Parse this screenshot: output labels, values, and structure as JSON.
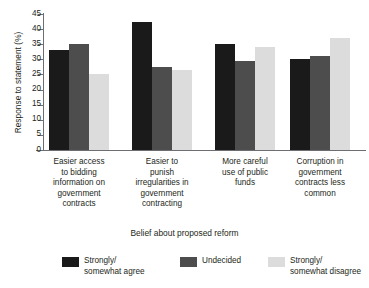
{
  "chart_data": {
    "type": "bar",
    "title": "",
    "xlabel": "Belief about proposed reform",
    "ylabel": "Response to statement (%)",
    "ylim": [
      0,
      45
    ],
    "yticks": [
      0,
      5,
      10,
      15,
      20,
      25,
      30,
      35,
      40,
      45
    ],
    "grid": false,
    "legend_position": "bottom",
    "categories": [
      "Easier access to bidding information on government contracts",
      "Easier to punish irregularities in government contracting",
      "More careful use of public funds",
      "Corruption in government contracts less common"
    ],
    "category_lines": [
      [
        "Easier access",
        "to bidding",
        "information on",
        "government",
        "contracts"
      ],
      [
        "Easier to",
        "punish",
        "irregularities in",
        "government",
        "contracting"
      ],
      [
        "More careful",
        "use of public",
        "funds"
      ],
      [
        "Corruption in",
        "government",
        "contracts less",
        "common"
      ]
    ],
    "series": [
      {
        "name": "Strongly/ somewhat agree",
        "name_lines": "Strongly/\nsomewhat agree",
        "color": "#1a1a1a",
        "values": [
          33,
          42.5,
          35,
          30
        ]
      },
      {
        "name": "Undecided",
        "name_lines": "Undecided",
        "color": "#4d4d4d",
        "values": [
          35,
          27.5,
          29.5,
          31
        ]
      },
      {
        "name": "Strongly/ somewhat disagree",
        "name_lines": "Strongly/\nsomewhat disagree",
        "color": "#dcdcdc",
        "values": [
          25,
          26.5,
          34,
          37
        ]
      }
    ]
  },
  "axis": {
    "y_title": "Response to statement (%)",
    "x_title": "Belief about proposed reform",
    "y_tick_labels": [
      "45",
      "40",
      "35",
      "30",
      "25",
      "20",
      "15",
      "10",
      "5",
      "0"
    ]
  },
  "legend": {
    "items": [
      {
        "label": "Strongly/\nsomewhat agree",
        "color": "#1a1a1a"
      },
      {
        "label": "Undecided",
        "color": "#4d4d4d"
      },
      {
        "label": "Strongly/\nsomewhat disagree",
        "color": "#dcdcdc"
      }
    ]
  }
}
